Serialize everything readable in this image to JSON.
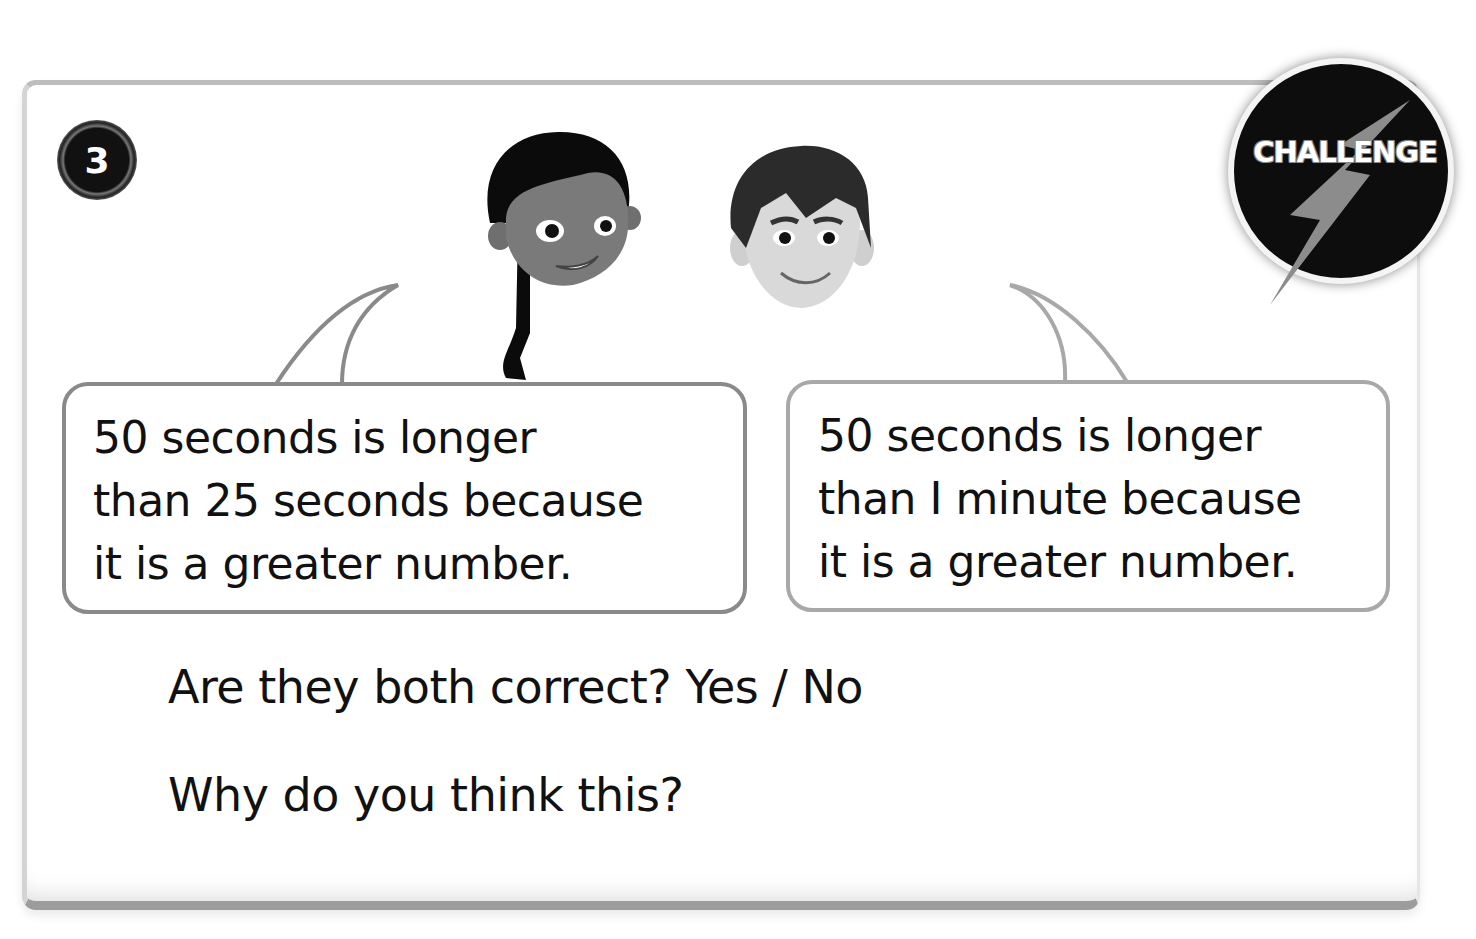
{
  "question": {
    "number": "3",
    "badge_label": "CHALLENGE"
  },
  "characters": [
    {
      "name": "girl",
      "speech": [
        "50 seconds is longer",
        "than 25 seconds because",
        "it is a greater number."
      ]
    },
    {
      "name": "boy",
      "speech": [
        "50 seconds is longer",
        "than I minute because",
        "it is a greater number."
      ]
    }
  ],
  "prompts": {
    "q1": "Are they both correct? Yes / No",
    "q2": "Why do you think this?"
  },
  "colors": {
    "ink": "#111111",
    "bubble_border": "#8a8a8a",
    "card_border": "#9c9c9c"
  }
}
